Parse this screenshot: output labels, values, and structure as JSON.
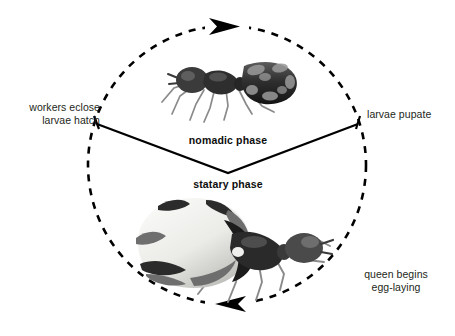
{
  "diagram": {
    "flow_direction": "clockwise",
    "colors": {
      "stroke": "#000000",
      "text": "#231f20",
      "phase_text": "#0d0d0d",
      "background": "#ffffff",
      "ant_dark": "#2b2b2b",
      "ant_mid": "#6e6e6e",
      "ant_light": "#d4d4d4",
      "brood_white": "#f4f4f2"
    },
    "cycle": {
      "center_x": 227,
      "center_y": 165,
      "radius": 139,
      "dash_pattern": "7 7"
    },
    "arrows": [
      {
        "name": "top-arrow",
        "position": "top",
        "direction": "clockwise-right"
      },
      {
        "name": "bottom-arrow",
        "position": "bottom",
        "direction": "clockwise-left"
      }
    ],
    "labels": {
      "workers_eclose": "workers eclose",
      "larvae_hatch": "larvae hatch",
      "larvae_pupate": "larvae pupate",
      "queen_begins": "queen begins",
      "egg_laying": "egg-laying"
    },
    "phases": {
      "nomadic": "nomadic phase",
      "statary": "statary phase"
    },
    "figures": {
      "nomadic_caption": "worker ant carrying brood",
      "statary_caption": "physogastric queen ant"
    }
  }
}
